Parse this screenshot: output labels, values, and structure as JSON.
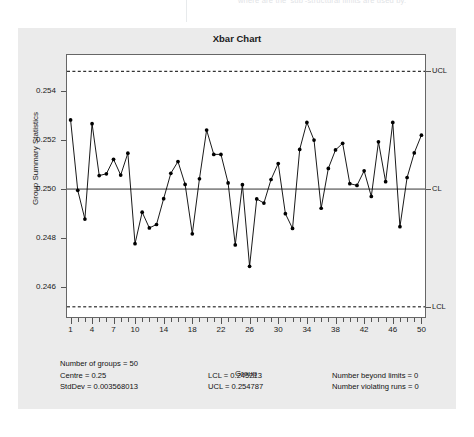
{
  "top_strip": {
    "ghost_text": "where are the 'sub'-structural limits are used by."
  },
  "chart": {
    "title": "Xbar Chart",
    "xlabel": "Group",
    "ylabel": "Group Summary Statistics",
    "y_ticks": [
      "0.254",
      "0.252",
      "0.250",
      "0.248",
      "0.246"
    ],
    "x_ticks": [
      "1",
      "4",
      "7",
      "10",
      "14",
      "18",
      "22",
      "26",
      "30",
      "34",
      "38",
      "42",
      "46",
      "50"
    ],
    "limit_labels": {
      "ucl": "UCL",
      "cl": "CL",
      "lcl": "LCL"
    }
  },
  "stats": {
    "number_of_groups": "Number of groups = 50",
    "centre": "Centre = 0.25",
    "stddev": "StdDev = 0.003568013",
    "lcl": "LCL = 0.245213",
    "ucl": "UCL = 0.254787",
    "beyond_limits": "Number beyond limits = 0",
    "violating_runs": "Number violating runs = 0"
  },
  "colors": {
    "panel_background": "#ebebeb",
    "plot_background": "#ffffff",
    "axis": "#555555",
    "point": "#000000",
    "line": "#000000",
    "limit_line": "#000000"
  },
  "chart_data": {
    "type": "line",
    "title": "Xbar Chart",
    "xlabel": "Group",
    "ylabel": "Group Summary Statistics",
    "x": [
      1,
      2,
      3,
      4,
      5,
      6,
      7,
      8,
      9,
      10,
      11,
      12,
      13,
      14,
      15,
      16,
      17,
      18,
      19,
      20,
      21,
      22,
      23,
      24,
      25,
      26,
      27,
      28,
      29,
      30,
      31,
      32,
      33,
      34,
      35,
      36,
      37,
      38,
      39,
      40,
      41,
      42,
      43,
      44,
      45,
      46,
      47,
      48,
      49,
      50
    ],
    "x_tick_values": [
      1,
      4,
      7,
      10,
      14,
      18,
      22,
      26,
      30,
      34,
      38,
      42,
      46,
      50
    ],
    "values": [
      0.25281,
      0.24995,
      0.24878,
      0.25266,
      0.25055,
      0.25062,
      0.25121,
      0.25057,
      0.25146,
      0.24778,
      0.24906,
      0.24842,
      0.24856,
      0.24961,
      0.25064,
      0.25112,
      0.25019,
      0.24818,
      0.25042,
      0.2524,
      0.25141,
      0.25141,
      0.25025,
      0.24773,
      0.25018,
      0.24686,
      0.2496,
      0.24943,
      0.25039,
      0.25104,
      0.249,
      0.2484,
      0.25161,
      0.25271,
      0.25199,
      0.24922,
      0.25084,
      0.25159,
      0.25186,
      0.25022,
      0.25015,
      0.25074,
      0.2497,
      0.25192,
      0.2503,
      0.25271,
      0.24847,
      0.25047,
      0.25147,
      0.25219
    ],
    "center_line": 0.25,
    "ucl": 0.254787,
    "lcl": 0.245213,
    "ylim": [
      0.2448,
      0.25545
    ],
    "yticks": [
      0.254,
      0.252,
      0.25,
      0.248,
      0.246
    ],
    "grid": false,
    "legend": false,
    "annotations": [
      "UCL",
      "CL",
      "LCL"
    ]
  }
}
